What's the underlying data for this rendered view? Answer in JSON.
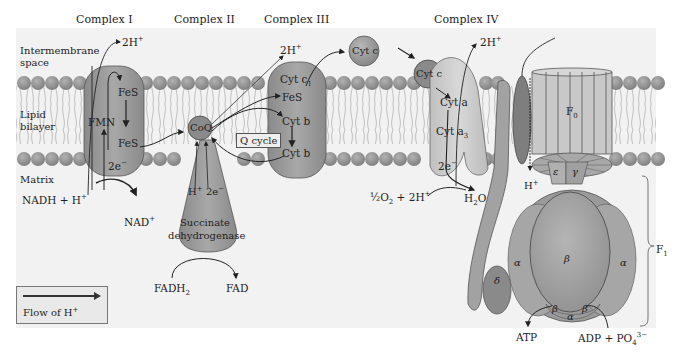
{
  "diagram": {
    "regions": {
      "intermembrane_space": "Intermembrane space",
      "intermembrane_line1": "Intermembrane",
      "intermembrane_line2": "space",
      "lipid_bilayer_line1": "Lipid",
      "lipid_bilayer_line2": "bilayer",
      "matrix": "Matrix"
    },
    "complexes": {
      "complex_1": {
        "label": "Complex I",
        "components": [
          "FMN",
          "FeS",
          "FeS"
        ],
        "fmn": "FMN",
        "fes_top": "FeS",
        "fes_bottom": "FeS",
        "electrons": "2e",
        "proton_out": "2H",
        "substrate": "NADH + H",
        "product": "NAD"
      },
      "complex_2": {
        "label": "Complex II",
        "coq": "CoQ",
        "proton": "H",
        "electrons": "2e",
        "enzyme_line1": "Succinate",
        "enzyme_line2": "dehydrogenase",
        "substrate": "FADH",
        "substrate_sub": "2",
        "product": "FAD"
      },
      "complex_3": {
        "label": "Complex III",
        "proton_out": "2H",
        "cyt_c1": "Cyt c",
        "cyt_c1_sub": "1",
        "fes": "FeS",
        "cyt_b_top": "Cyt b",
        "cyt_b_bottom": "Cyt b",
        "q_cycle": "Q cycle"
      },
      "cytochrome_c": {
        "free": "Cyt c",
        "bound": "Cyt c"
      },
      "complex_4": {
        "label": "Complex IV",
        "proton_out": "2H",
        "cyt_a": "Cyt a",
        "cyt_a3": "Cyt a",
        "cyt_a3_sub": "3",
        "electrons": "2e",
        "reactant_frac": "½",
        "reactant": "O",
        "reactant_sub": "2",
        "reactant_tail": " + 2H",
        "product": "H",
        "product_sub": "2",
        "product_tail": "O"
      },
      "atp_synthase": {
        "f0": "F",
        "f0_sub": "0",
        "f1": "F",
        "f1_sub": "1",
        "proton_in": "H",
        "epsilon": "ε",
        "gamma": "γ",
        "alpha_left": "α",
        "alpha_right": "α",
        "alpha_bottom": "α",
        "beta_center": "β",
        "beta_bottom_left": "β",
        "beta_bottom_right": "β",
        "delta": "δ",
        "product": "ATP",
        "substrate": "ADP + PO",
        "substrate_sub": "4",
        "substrate_sup": "3−"
      }
    },
    "symbols": {
      "plus": "+",
      "minus": "−"
    },
    "legend": {
      "label": "Flow of H",
      "label_sup": "+",
      "arrow_icon": "right-arrow"
    },
    "colors": {
      "membrane_head": "#8e8e8e",
      "membrane_tail": "#b8b8b8",
      "protein_dark": "#8c8c8c",
      "protein_mid": "#a4a4a4",
      "protein_light": "#c8c8c8",
      "background_band": "#efefef",
      "text": "#1e1e1e"
    }
  }
}
